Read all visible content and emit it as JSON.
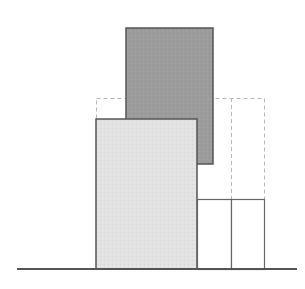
{
  "diagram": {
    "width": 305,
    "height": 289,
    "colors": {
      "background": "#ffffff",
      "dark_fill": "#9c9c9c",
      "dark_stroke": "#555555",
      "light_fill": "#e2e2e2",
      "light_stroke": "#555555",
      "dashed_stroke": "#b8b8b8",
      "outline_stroke": "#666666",
      "baseline": "#555555"
    },
    "baseline": {
      "x1": 17,
      "x2": 297,
      "y": 269
    },
    "dark_block": {
      "x": 126,
      "y": 28,
      "width": 87,
      "height": 136
    },
    "dashed_outline": {
      "x": 96,
      "y": 98,
      "width": 168,
      "divider_x": 231,
      "bottom": 199
    },
    "light_block": {
      "x": 96,
      "y": 119,
      "width": 101,
      "height": 150
    },
    "small_boxes": [
      {
        "x": 197,
        "y": 199,
        "width": 34,
        "height": 70
      },
      {
        "x": 231,
        "y": 199,
        "width": 33,
        "height": 70
      }
    ]
  }
}
